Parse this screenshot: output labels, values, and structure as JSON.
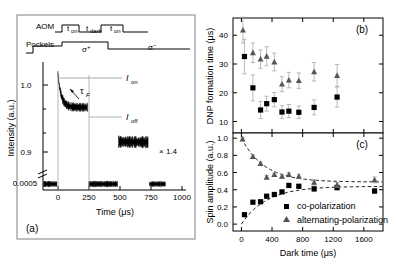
{
  "figure": {
    "panels": [
      "(a)",
      "(b)",
      "(c)"
    ]
  },
  "panel_a": {
    "label": "(a)",
    "sequence": {
      "rows": [
        {
          "name": "AOM",
          "labels": [
            "t_on",
            "t_dark",
            "t_on"
          ],
          "label_sub": [
            "on",
            "dark",
            "on"
          ],
          "label_base": "t"
        },
        {
          "name": "Pockels",
          "labels": [
            "σ+",
            "σ-"
          ]
        }
      ],
      "aom_name": "AOM",
      "pockels_name": "Pockels",
      "t_base": "t",
      "sub_on": "on",
      "sub_dark": "dark",
      "sigma": "σ",
      "sup_plus": "+",
      "sup_minus": "−"
    },
    "annotations": {
      "i_on": "I",
      "i_on_sub": "on",
      "i_off": "I",
      "i_off_sub": "off",
      "tau": "τ",
      "tau_sub": "F",
      "scale": "× 1.4",
      "baseline": "0.0005"
    },
    "xlabel": "Time (μs)",
    "ylabel": "Intensity (a.u.)",
    "xticks": [
      "0",
      "250",
      "500",
      "750",
      "1000"
    ],
    "xtick_values": [
      0,
      250,
      500,
      750,
      1000
    ],
    "yticks": [
      "0.9",
      "1.0"
    ],
    "ytick_values": [
      0.9,
      1.0
    ],
    "xlim": [
      -120,
      1060
    ],
    "ylim": [
      0.855,
      1.035
    ]
  },
  "chart_data": [
    {
      "type": "scatter",
      "panel": "(b)",
      "title": "",
      "xlabel": "",
      "ylabel": "DNP formation time (μs)",
      "ylim": [
        6,
        46
      ],
      "xlim": [
        -110,
        1850
      ],
      "yticks": [
        10,
        20,
        30,
        40
      ],
      "xticks": [
        0,
        400,
        800,
        1200,
        1600
      ],
      "grid": false,
      "legend": "none",
      "series": [
        {
          "name": "co-polarization",
          "marker": "square",
          "color": "#000000",
          "x": [
            40,
            150,
            250,
            330,
            430,
            530,
            620,
            750,
            950,
            1250,
            1740
          ],
          "y": [
            32.6,
            21.7,
            14.0,
            16.2,
            17.6,
            13.3,
            13.6,
            13.2,
            14.9,
            18.5
          ],
          "yerr": [
            6.0,
            4.5,
            3.0,
            2.6,
            2.5,
            2.2,
            2.3,
            2.2,
            2.6,
            3.5
          ]
        },
        {
          "name": "alternating-polarization",
          "marker": "triangle",
          "color": "#555555",
          "x": [
            20,
            150,
            250,
            330,
            430,
            530,
            620,
            750,
            950,
            1250,
            1740
          ],
          "y": [
            41.8,
            33.9,
            31.7,
            32.7,
            30.7,
            23.0,
            24.4,
            24.2,
            27.3,
            26.0
          ],
          "yerr": [
            4.5,
            3.4,
            3.2,
            3.3,
            3.1,
            2.6,
            2.7,
            2.7,
            3.2,
            3.8
          ]
        }
      ]
    },
    {
      "type": "scatter",
      "panel": "(c)",
      "title": "",
      "xlabel": "Dark time (μs)",
      "ylabel": "Spin amplitude (a.u.)",
      "ylim": [
        -0.08,
        1.06
      ],
      "xlim": [
        -110,
        1850
      ],
      "yticks": [
        0.0,
        0.2,
        0.4,
        0.6,
        0.8,
        1.0
      ],
      "ytick_labels": [
        "0.0",
        "0.2",
        "0.4",
        "0.6",
        "0.8",
        "1.0"
      ],
      "xticks": [
        0,
        400,
        800,
        1200,
        1600
      ],
      "grid": false,
      "legend": "inside-bottom",
      "series": [
        {
          "name": "co-polarization",
          "marker": "square",
          "color": "#000000",
          "x": [
            40,
            150,
            250,
            330,
            430,
            530,
            620,
            750,
            950,
            1250,
            1740
          ],
          "y": [
            0.11,
            0.255,
            0.26,
            0.325,
            0.345,
            0.375,
            0.45,
            0.44,
            0.41,
            0.425,
            0.385
          ],
          "yerr": [
            0.02,
            0.02,
            0.02,
            0.02,
            0.02,
            0.02,
            0.025,
            0.025,
            0.03,
            0.03,
            0.03
          ],
          "fit": {
            "type": "rising-exponential",
            "y0": 0.0,
            "yinf": 0.44,
            "tau": 330
          }
        },
        {
          "name": "alternating-polarization",
          "marker": "triangle",
          "color": "#555555",
          "x": [
            15,
            150,
            250,
            330,
            430,
            530,
            620,
            750,
            950,
            1250,
            1740
          ],
          "y": [
            0.99,
            0.785,
            0.705,
            0.545,
            0.575,
            0.555,
            0.575,
            0.555,
            0.485,
            0.455,
            0.515
          ],
          "yerr": [
            0.02,
            0.02,
            0.02,
            0.02,
            0.02,
            0.02,
            0.025,
            0.025,
            0.03,
            0.03,
            0.035
          ],
          "fit": {
            "type": "falling-exponential",
            "y0": 1.0,
            "yinf": 0.49,
            "tau": 300
          }
        }
      ],
      "legend_entries": [
        {
          "label": "co-polarization",
          "marker": "square"
        },
        {
          "label": "alternating-polarization",
          "marker": "triangle"
        }
      ]
    }
  ]
}
